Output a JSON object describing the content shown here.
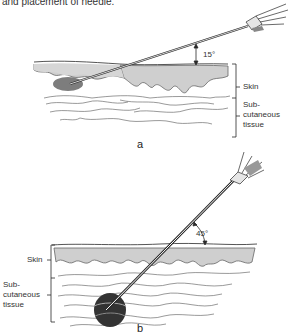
{
  "caption": "and placement of needle.",
  "panel_a": {
    "letter": "a",
    "angle": "15°",
    "labels": {
      "skin": "Skin",
      "subcutaneous_1": "Sub-",
      "subcutaneous_2": "cutaneous",
      "subcutaneous_3": "tissue"
    },
    "description": "Needle inserted at 15° into skin layer (intradermal)"
  },
  "panel_b": {
    "letter": "b",
    "angle": "45°",
    "labels": {
      "skin": "Skin",
      "subcutaneous_1": "Sub-",
      "subcutaneous_2": "cutaneous",
      "subcutaneous_3": "tissue"
    },
    "description": "Needle inserted at 45° into subcutaneous tissue"
  },
  "colors": {
    "ink": "#2a2a2a",
    "skin_fill": "#cfcfcf",
    "bleb": "#555555",
    "paper": "#ffffff"
  }
}
